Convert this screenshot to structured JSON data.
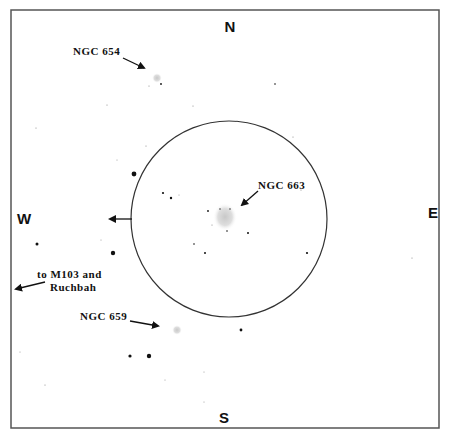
{
  "frame": {
    "x": 11,
    "y": 10,
    "w": 428,
    "h": 418,
    "stroke": "#555555"
  },
  "directions": {
    "north": {
      "label": "N",
      "x": 230,
      "y": 32
    },
    "south": {
      "label": "S",
      "x": 224,
      "y": 423
    },
    "west": {
      "label": "W",
      "x": 17,
      "y": 224
    },
    "east": {
      "label": "E",
      "x": 428,
      "y": 218
    }
  },
  "field_circle": {
    "cx": 229,
    "cy": 219,
    "r": 98,
    "stroke": "#333333"
  },
  "labels": {
    "ngc654": {
      "text": "NGC 654",
      "x": 73,
      "y": 55
    },
    "ngc663": {
      "text": "NGC 663",
      "x": 258,
      "y": 189
    },
    "ngc659": {
      "text": "NGC 659",
      "x": 80,
      "y": 320
    },
    "m103_line1": {
      "text": "to M103 and",
      "x": 37,
      "y": 278
    },
    "m103_line2": {
      "text": "Ruchbah",
      "x": 50,
      "y": 291
    }
  },
  "objects": [
    {
      "name": "NGC 654",
      "type": "open-cluster",
      "x": 157,
      "y": 78
    },
    {
      "name": "NGC 663",
      "type": "open-cluster",
      "x": 225,
      "y": 217
    },
    {
      "name": "NGC 659",
      "type": "open-cluster",
      "x": 177,
      "y": 330
    }
  ],
  "stars": [
    {
      "x": 134,
      "y": 174,
      "r": 2.4
    },
    {
      "x": 113,
      "y": 253,
      "r": 2.2
    },
    {
      "x": 37,
      "y": 244,
      "r": 1.5
    },
    {
      "x": 130,
      "y": 356,
      "r": 1.6
    },
    {
      "x": 149,
      "y": 356,
      "r": 2.2
    },
    {
      "x": 241,
      "y": 330,
      "r": 1.4
    },
    {
      "x": 163,
      "y": 193,
      "r": 1.1
    },
    {
      "x": 171,
      "y": 198,
      "r": 1.2
    },
    {
      "x": 208,
      "y": 211,
      "r": 0.9
    },
    {
      "x": 248,
      "y": 233,
      "r": 1.0
    },
    {
      "x": 205,
      "y": 253,
      "r": 1.0
    },
    {
      "x": 307,
      "y": 253,
      "r": 1.1
    },
    {
      "x": 194,
      "y": 244,
      "r": 0.8
    },
    {
      "x": 301,
      "y": 190,
      "r": 0.6
    },
    {
      "x": 412,
      "y": 258,
      "r": 0.6
    },
    {
      "x": 275,
      "y": 84,
      "r": 0.8
    },
    {
      "x": 161,
      "y": 84,
      "r": 0.9
    },
    {
      "x": 149,
      "y": 86,
      "r": 0.6
    },
    {
      "x": 107,
      "y": 105,
      "r": 0.6
    },
    {
      "x": 36,
      "y": 128,
      "r": 0.6
    },
    {
      "x": 193,
      "y": 106,
      "r": 0.6
    },
    {
      "x": 146,
      "y": 146,
      "r": 0.6
    },
    {
      "x": 237,
      "y": 121,
      "r": 0.5
    },
    {
      "x": 293,
      "y": 137,
      "r": 0.6
    },
    {
      "x": 20,
      "y": 352,
      "r": 0.5
    },
    {
      "x": 45,
      "y": 385,
      "r": 0.6
    },
    {
      "x": 165,
      "y": 380,
      "r": 0.5
    },
    {
      "x": 204,
      "y": 372,
      "r": 0.5
    },
    {
      "x": 204,
      "y": 402,
      "r": 0.5
    },
    {
      "x": 101,
      "y": 240,
      "r": 0.5
    },
    {
      "x": 117,
      "y": 160,
      "r": 0.5
    },
    {
      "x": 227,
      "y": 231,
      "r": 0.8
    },
    {
      "x": 220,
      "y": 209,
      "r": 0.7
    },
    {
      "x": 230,
      "y": 209,
      "r": 0.7
    },
    {
      "x": 179,
      "y": 195,
      "r": 0.5
    },
    {
      "x": 212,
      "y": 225,
      "r": 0.6
    }
  ],
  "arrows": [
    {
      "name": "ngc654-arrow",
      "x1": 123,
      "y1": 58,
      "x2": 144,
      "y2": 68
    },
    {
      "name": "ngc663-arrow",
      "x1": 258,
      "y1": 191,
      "x2": 242,
      "y2": 205
    },
    {
      "name": "ngc659-arrow",
      "x1": 130,
      "y1": 321,
      "x2": 158,
      "y2": 326
    },
    {
      "name": "west-field-arrow",
      "x1": 132,
      "y1": 219,
      "x2": 110,
      "y2": 219
    },
    {
      "name": "m103-arrow",
      "x1": 45,
      "y1": 282,
      "x2": 16,
      "y2": 289
    }
  ]
}
